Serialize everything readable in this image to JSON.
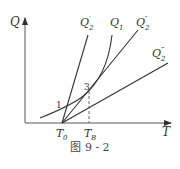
{
  "figure": {
    "caption": "图 9 - 2",
    "axes": {
      "y_label": "Q",
      "x_label": "T",
      "x_ticks": [
        {
          "main": "T",
          "sub": "0"
        },
        {
          "main": "T",
          "sub": "B"
        }
      ]
    },
    "curves": [
      {
        "id": "Q2p",
        "main": "Q",
        "sub": "2",
        "sup": "′",
        "kind": "line"
      },
      {
        "id": "Q1",
        "main": "Q",
        "sub": "1",
        "sup": "",
        "kind": "curve"
      },
      {
        "id": "Q2pp",
        "main": "Q",
        "sub": "2",
        "sup": "″",
        "kind": "line"
      },
      {
        "id": "Q2ppp",
        "main": "Q",
        "sub": "2",
        "sup": "‴",
        "kind": "line"
      }
    ],
    "points": [
      {
        "label": "1"
      },
      {
        "label": "3"
      }
    ],
    "colors": {
      "stroke": "#333333",
      "axis": "#555555"
    }
  }
}
